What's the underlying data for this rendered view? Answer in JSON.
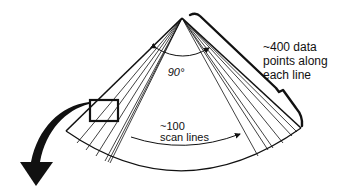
{
  "diagram": {
    "colors": {
      "ink": "#111111",
      "background": "#ffffff"
    },
    "labels": {
      "angle": "90°",
      "data_points": [
        "~400 data",
        "points along",
        "each line"
      ],
      "scan_lines": [
        "~100",
        "scan lines"
      ]
    },
    "elements": {
      "sector": {
        "apex": [
          182,
          18
        ],
        "angle_deg": 90
      },
      "scan_line_count": "~100",
      "points_per_line": "~400",
      "magnify_box": {
        "x": 90,
        "y": 100,
        "w": 28,
        "h": 21
      },
      "callout_arrow": "curved arrow from box pointing down-left"
    }
  }
}
